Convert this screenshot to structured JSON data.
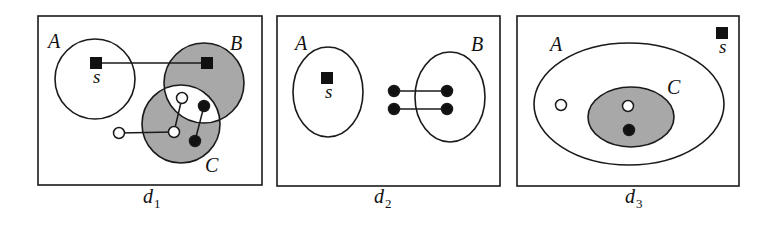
{
  "colors": {
    "stroke": "#1a1a1a",
    "shade": "#a8a8a8",
    "node_fill_black": "#111111",
    "node_fill_white": "#ffffff"
  },
  "panels": [
    {
      "id": "d1",
      "caption": {
        "base": "d",
        "sub": "1",
        "x": 143,
        "y": 203
      },
      "frame": {
        "x": 38,
        "y": 16,
        "w": 224,
        "h": 169
      },
      "sets": [
        {
          "name": "A",
          "shape": "circle",
          "cx": 95,
          "cy": 79,
          "rx": 40,
          "ry": 40,
          "shaded": false,
          "label_x": 48,
          "label_y": 48
        },
        {
          "name": "B",
          "shape": "circle",
          "cx": 204,
          "cy": 83,
          "rx": 40,
          "ry": 40,
          "shaded": true,
          "label_x": 230,
          "label_y": 50
        },
        {
          "name": "C",
          "shape": "circle",
          "cx": 181,
          "cy": 124,
          "rx": 39,
          "ry": 39,
          "shaded": true,
          "label_x": 205,
          "label_y": 172
        }
      ],
      "intersection_white": [
        "B",
        "C"
      ],
      "source": {
        "label": "s",
        "x": 96,
        "y": 63,
        "label_x": 93,
        "label_y": 83
      },
      "nodes": [
        {
          "kind": "square",
          "x": 207,
          "y": 63
        },
        {
          "kind": "hollow",
          "x": 182,
          "y": 98
        },
        {
          "kind": "hollow",
          "x": 174,
          "y": 132
        },
        {
          "kind": "hollow",
          "x": 119,
          "y": 133
        },
        {
          "kind": "filled",
          "x": 204,
          "y": 106
        },
        {
          "kind": "filled",
          "x": 195,
          "y": 141
        }
      ],
      "edges": [
        [
          96,
          63,
          207,
          63
        ],
        [
          119,
          133,
          174,
          132
        ],
        [
          174,
          132,
          182,
          98
        ],
        [
          204,
          106,
          195,
          141
        ]
      ]
    },
    {
      "id": "d2",
      "caption": {
        "base": "d",
        "sub": "2",
        "x": 374,
        "y": 203
      },
      "frame": {
        "x": 277,
        "y": 16,
        "w": 223,
        "h": 170
      },
      "sets": [
        {
          "name": "A",
          "shape": "ellipse",
          "cx": 328,
          "cy": 92,
          "rx": 35,
          "ry": 45,
          "shaded": false,
          "label_x": 295,
          "label_y": 50
        },
        {
          "name": "B",
          "shape": "ellipse",
          "cx": 450,
          "cy": 97,
          "rx": 35,
          "ry": 45,
          "shaded": false,
          "label_x": 471,
          "label_y": 51
        }
      ],
      "intersection_white": [],
      "source": {
        "label": "s",
        "x": 327,
        "y": 78,
        "label_x": 325,
        "label_y": 98
      },
      "nodes": [
        {
          "kind": "filled",
          "x": 394,
          "y": 91
        },
        {
          "kind": "filled",
          "x": 447,
          "y": 91
        },
        {
          "kind": "filled",
          "x": 394,
          "y": 109
        },
        {
          "kind": "filled",
          "x": 447,
          "y": 109
        }
      ],
      "edges": [
        [
          394,
          91,
          447,
          91
        ],
        [
          394,
          109,
          447,
          109
        ]
      ]
    },
    {
      "id": "d3",
      "caption": {
        "base": "d",
        "sub": "3",
        "x": 625,
        "y": 203
      },
      "frame": {
        "x": 517,
        "y": 16,
        "w": 222,
        "h": 170
      },
      "sets": [
        {
          "name": "A",
          "shape": "ellipse",
          "cx": 629,
          "cy": 104,
          "rx": 95,
          "ry": 61,
          "shaded": false,
          "label_x": 550,
          "label_y": 51
        },
        {
          "name": "C",
          "shape": "ellipse",
          "cx": 631,
          "cy": 117,
          "rx": 43,
          "ry": 30,
          "shaded": true,
          "label_x": 667,
          "label_y": 94
        }
      ],
      "intersection_white": [],
      "source": {
        "label": "s",
        "x": 722,
        "y": 33,
        "label_x": 719,
        "label_y": 53
      },
      "nodes": [
        {
          "kind": "hollow",
          "x": 561,
          "y": 105
        },
        {
          "kind": "hollow",
          "x": 628,
          "y": 106
        },
        {
          "kind": "filled",
          "x": 629,
          "y": 130
        }
      ],
      "edges": []
    }
  ]
}
